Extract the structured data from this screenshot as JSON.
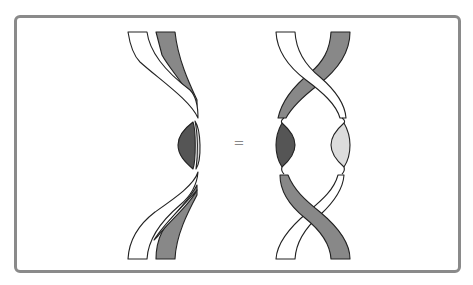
{
  "figure": {
    "type": "ribbon-braid-identity",
    "operator": "=",
    "colors": {
      "frame": "#8a8a8a",
      "outline": "#222222",
      "strip_white": "#ffffff",
      "strip_gray": "#888888",
      "lens_dark": "#555555",
      "lens_light": "#dcdcdc"
    },
    "left_diagram": {
      "label": "",
      "strands": [
        "white-ribbon",
        "gray-ribbon"
      ],
      "description": "two parallel ribbons bending together with a dark and light lens between them"
    },
    "right_diagram": {
      "label": "",
      "strands": [
        "white-ribbon",
        "gray-ribbon"
      ],
      "description": "two ribbons crossing twice with a dark lens on the left and a light lens on the right"
    }
  }
}
